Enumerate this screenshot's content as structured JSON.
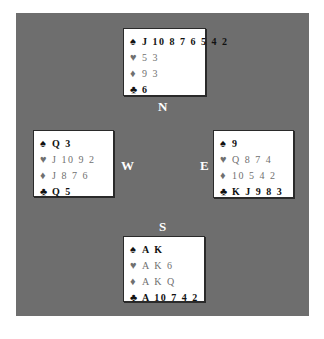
{
  "diagram": {
    "type": "bridge-deal",
    "background_color": "#6e6e6e",
    "hands": {
      "north": {
        "label": "N",
        "spades": "J 10 8 7 6 5 4 2",
        "hearts": "5 3",
        "diamonds": "9 3",
        "clubs": "6"
      },
      "west": {
        "label": "W",
        "spades": "Q 3",
        "hearts": "J 10 9 2",
        "diamonds": "J 8 7 6",
        "clubs": "Q 5"
      },
      "east": {
        "label": "E",
        "spades": "9",
        "hearts": "Q 8 7 4",
        "diamonds": "10 5 4 2",
        "clubs": "K J 9 8 3"
      },
      "south": {
        "label": "S",
        "spades": "A K",
        "hearts": "A K 6",
        "diamonds": "A K Q",
        "clubs": "A 10 7 4 2"
      }
    },
    "suit_symbols": {
      "spades": "♠",
      "hearts": "♥",
      "diamonds": "♦",
      "clubs": "♣"
    }
  }
}
